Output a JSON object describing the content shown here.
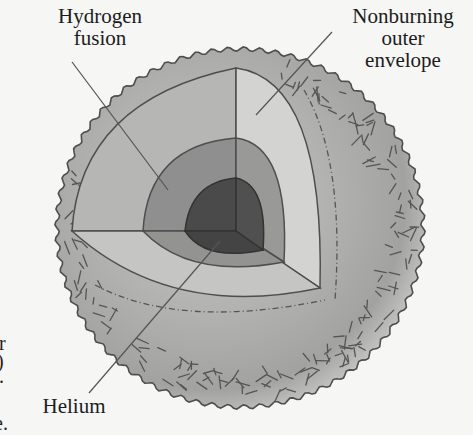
{
  "diagram": {
    "type": "star-interior-cutaway",
    "labels": {
      "hydrogen_fusion": [
        "Hydrogen",
        "fusion"
      ],
      "nonburning_envelope": [
        "Nonburning",
        "outer",
        "envelope"
      ],
      "helium": "Helium"
    },
    "layers": [
      {
        "name": "helium-core",
        "color": "#4a4a4a"
      },
      {
        "name": "hydrogen-fusion-shell",
        "color": "#8c8c8c"
      },
      {
        "name": "inner-envelope-cut",
        "color": "#b8b8b6"
      },
      {
        "name": "outer-envelope-surface",
        "color": "#a9a9a7"
      }
    ],
    "edge_fragments": [
      "r",
      ")",
      ".",
      "e."
    ]
  },
  "colors": {
    "background": "#f6f6f4",
    "outline": "#4e4e4e",
    "leader_line": "#555555",
    "core": "#474747",
    "shell": "#8d8d8d",
    "cut_left": "#b5b5b3",
    "cut_right": "#d2d2d0",
    "cut_bottom": "#c4c4c2",
    "surface": "#a8a8a6"
  }
}
